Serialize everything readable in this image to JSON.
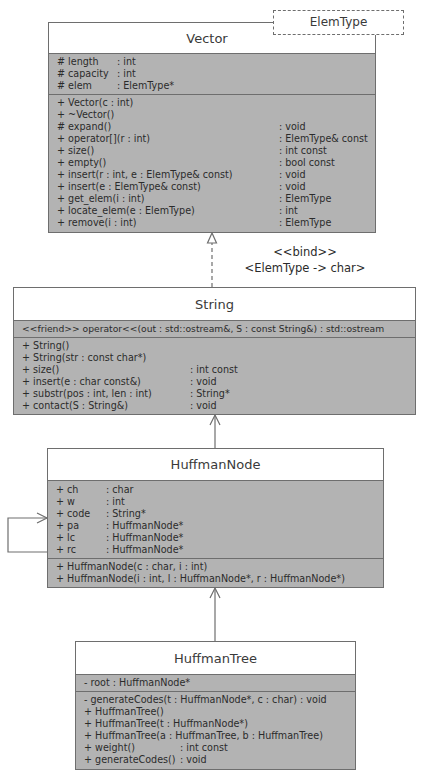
{
  "template_param": {
    "label": "ElemType"
  },
  "vector": {
    "name": "Vector",
    "attributes": [
      {
        "name": "# length",
        "type": ": int"
      },
      {
        "name": "# capacity",
        "type": ": int"
      },
      {
        "name": "# elem",
        "type": ": ElemType*"
      }
    ],
    "operations": [
      {
        "sig": "+ Vector(c : int)",
        "ret": ""
      },
      {
        "sig": "+ ~Vector()",
        "ret": ""
      },
      {
        "sig": "# expand()",
        "ret": ": void"
      },
      {
        "sig": "+ operator[](r : int)",
        "ret": ": ElemType& const"
      },
      {
        "sig": "+ size()",
        "ret": ": int const"
      },
      {
        "sig": "+ empty()",
        "ret": ": bool const"
      },
      {
        "sig": "+ insert(r : int, e : ElemType& const)",
        "ret": ": void"
      },
      {
        "sig": "+ insert(e : ElemType& const)",
        "ret": ": void"
      },
      {
        "sig": "+ get_elem(i : int)",
        "ret": ": ElemType"
      },
      {
        "sig": "+ locate_elem(e : ElemType)",
        "ret": ": int"
      },
      {
        "sig": "+ remove(i : int)",
        "ret": ": ElemType"
      }
    ]
  },
  "bind": {
    "stereotype": "<<bind>>",
    "binding": "<ElemType -> char>"
  },
  "string": {
    "name": "String",
    "friends": [
      {
        "text": "<<friend>> operator<<(out : std::ostream&, S : const String&) : std::ostream"
      }
    ],
    "operations": [
      {
        "sig": "+ String()",
        "ret": ""
      },
      {
        "sig": "+ String(str : const char*)",
        "ret": ""
      },
      {
        "sig": "+ size()",
        "ret": ": int const"
      },
      {
        "sig": "+ insert(e : char const&)",
        "ret": ": void"
      },
      {
        "sig": "+ substr(pos : int, len : int)",
        "ret": ": String*"
      },
      {
        "sig": "+ contact(S : String&)",
        "ret": ": void"
      }
    ]
  },
  "huffman_node": {
    "name": "HuffmanNode",
    "attributes": [
      {
        "name": "+ ch",
        "type": ": char"
      },
      {
        "name": "+ w",
        "type": ": int"
      },
      {
        "name": "+ code",
        "type": ": String*"
      },
      {
        "name": "+ pa",
        "type": ": HuffmanNode*"
      },
      {
        "name": "+ lc",
        "type": ": HuffmanNode*"
      },
      {
        "name": "+ rc",
        "type": ": HuffmanNode*"
      }
    ],
    "operations": [
      {
        "sig": "+ HuffmanNode(c : char, i : int)",
        "ret": ""
      },
      {
        "sig": "+ HuffmanNode(i : int, l : HuffmanNode*, r : HuffmanNode*)",
        "ret": ""
      }
    ]
  },
  "huffman_tree": {
    "name": "HuffmanTree",
    "attributes": [
      {
        "text": "- root : HuffmanNode*"
      }
    ],
    "operations": [
      {
        "sig": "- generateCodes(t : HuffmanNode*, c : char) : void",
        "ret": ""
      },
      {
        "sig": "+ HuffmanTree()",
        "ret": ""
      },
      {
        "sig": "+ HuffmanTree(t : HuffmanNode*)",
        "ret": ""
      },
      {
        "sig": "+ HuffmanTree(a : HuffmanTree, b : HuffmanTree)",
        "ret": ""
      },
      {
        "sig": "+ weight()",
        "ret": ": int const"
      },
      {
        "sig": "+ generateCodes()",
        "ret": ": void"
      }
    ]
  },
  "colors": {
    "body_fill": "#b3b3b3",
    "header_fill": "#ffffff",
    "border": "#6e6e6e",
    "text": "#2b2b2b"
  }
}
